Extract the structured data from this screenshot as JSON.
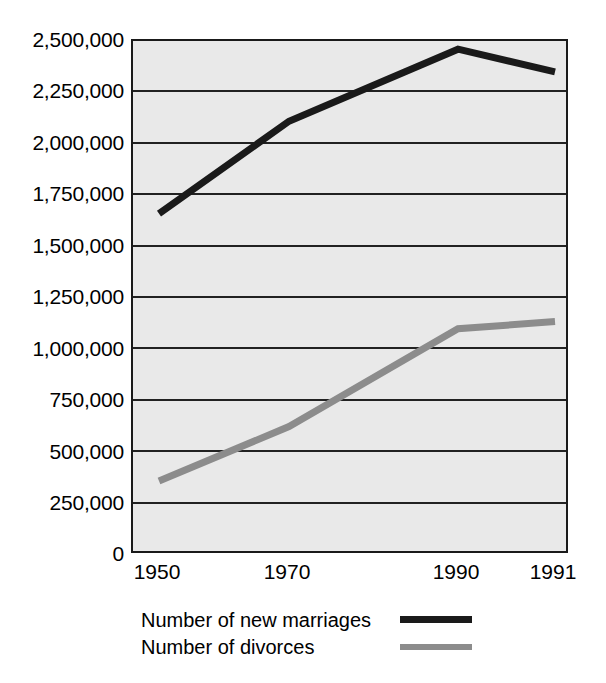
{
  "chart_data": {
    "type": "line",
    "title": "",
    "subtitle": "",
    "xlabel": "",
    "ylabel": "",
    "x": [
      1950,
      1970,
      1990,
      1991
    ],
    "categories": [
      "1950",
      "1970",
      "1990",
      "1991"
    ],
    "xticklabels": [
      "1950",
      "1970",
      "1990",
      "1991"
    ],
    "yticklabels": [
      "2,500,000",
      "2,250,000",
      "2,000,000",
      "1,750,000",
      "1,500,000",
      "1,250,000",
      "1,000,000",
      "750,000",
      "500,000",
      "250,000",
      "0"
    ],
    "ytickvalues": [
      2500000,
      2250000,
      2000000,
      1750000,
      1500000,
      1250000,
      1000000,
      750000,
      500000,
      250000,
      0
    ],
    "ylim": [
      0,
      2500000
    ],
    "xlim": [
      1950,
      1991
    ],
    "grid": "horizontal",
    "legend_position": "below-axes-left",
    "plot_background": "#e9e9e9",
    "series": [
      {
        "name": "Number of new marriages",
        "color": "#1a1a1a",
        "values": [
          1660000,
          2110000,
          2460000,
          2350000
        ]
      },
      {
        "name": "Number of divorces",
        "color": "#8c8c8c",
        "values": [
          360000,
          625000,
          1100000,
          1135000
        ]
      }
    ]
  },
  "legend": {
    "items": [
      {
        "label": "Number of new marriages",
        "color": "#1a1a1a"
      },
      {
        "label": "Number of divorces",
        "color": "#8c8c8c"
      }
    ]
  },
  "axes": {
    "y": {
      "ticks": [
        {
          "label": "2,500,000",
          "value": 2500000
        },
        {
          "label": "2,250,000",
          "value": 2250000
        },
        {
          "label": "2,000,000",
          "value": 2000000
        },
        {
          "label": "1,750,000",
          "value": 1750000
        },
        {
          "label": "1,500,000",
          "value": 1500000
        },
        {
          "label": "1,250,000",
          "value": 1250000
        },
        {
          "label": "1,000,000",
          "value": 1000000
        },
        {
          "label": "750,000",
          "value": 750000
        },
        {
          "label": "500,000",
          "value": 500000
        },
        {
          "label": "250,000",
          "value": 250000
        },
        {
          "label": "0",
          "value": 0
        }
      ]
    },
    "x": {
      "ticks": [
        {
          "label": "1950",
          "value": 1950
        },
        {
          "label": "1970",
          "value": 1970
        },
        {
          "label": "1990",
          "value": 1990
        },
        {
          "label": "1991",
          "value": 1991
        }
      ]
    }
  }
}
